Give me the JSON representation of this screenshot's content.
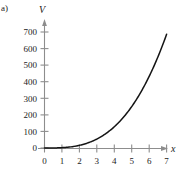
{
  "panel": {
    "label": "a)"
  },
  "chart_data": {
    "type": "line",
    "title": "",
    "xlabel": "x",
    "ylabel": "V",
    "xlim": [
      0,
      7.6
    ],
    "ylim": [
      0,
      745
    ],
    "grid": false,
    "legend": null,
    "xticks": [
      "0",
      "1",
      "2",
      "3",
      "4",
      "5",
      "6",
      "7"
    ],
    "xtick_values": [
      0,
      1,
      2,
      3,
      4,
      5,
      6,
      7
    ],
    "yticks": [
      "0",
      "100",
      "200",
      "300",
      "400",
      "500",
      "600",
      "700"
    ],
    "ytick_values": [
      0,
      100,
      200,
      300,
      400,
      500,
      600,
      700
    ],
    "series": [
      {
        "name": "V",
        "relation": "V = 2x^3",
        "x": [
          0,
          0.5,
          1,
          1.5,
          2,
          2.5,
          3,
          3.5,
          4,
          4.5,
          5,
          5.5,
          6,
          6.5,
          7
        ],
        "values": [
          0,
          0.25,
          2,
          6.75,
          16,
          31.25,
          54,
          85.75,
          128,
          182.25,
          250,
          332.75,
          432,
          549.25,
          686
        ]
      }
    ],
    "colors": {
      "curve": "#141414",
      "axis": "#8d8d8d",
      "text": "#1b1b1b",
      "background": "#ffffff"
    }
  }
}
